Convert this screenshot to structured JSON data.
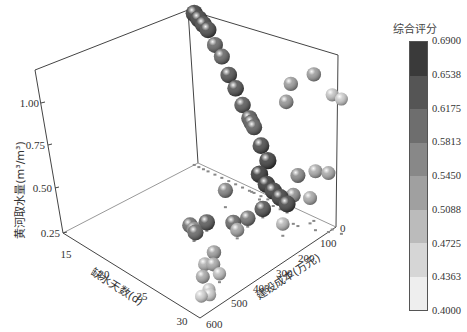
{
  "chart_data": {
    "type": "scatter",
    "dimensions": 3,
    "title": "",
    "xlabel": "缺水天数(d)",
    "ylabel": "建设成本(万元)",
    "zlabel": "黄河取水量(m³/m³)",
    "x_ticks": [
      "15",
      "20",
      "25",
      "30"
    ],
    "y_ticks": [
      "0",
      "100",
      "200",
      "300",
      "400",
      "500",
      "600"
    ],
    "z_ticks": [
      "0.25",
      "0.50",
      "0.75",
      "1.00"
    ],
    "xlim": [
      13,
      31
    ],
    "ylim": [
      0,
      600
    ],
    "zlim": [
      0.25,
      1.2
    ],
    "colorbar": {
      "title": "综合评分",
      "ticks": [
        "0.6900",
        "0.6538",
        "0.6175",
        "0.5813",
        "0.5450",
        "0.5088",
        "0.4725",
        "0.4363",
        "0.4000"
      ],
      "colors": [
        "#3a3a3a",
        "#555555",
        "#6e6e6e",
        "#888888",
        "#a0a0a0",
        "#bbbbbb",
        "#d6d6d6",
        "#eeeeee"
      ],
      "range": [
        0.4,
        0.69
      ]
    },
    "points": [
      {
        "x": 13.5,
        "y": 0,
        "z": 1.15,
        "score": 0.66
      },
      {
        "x": 13.5,
        "y": 20,
        "z": 1.13,
        "score": 0.66
      },
      {
        "x": 13.5,
        "y": 40,
        "z": 1.11,
        "score": 0.65
      },
      {
        "x": 13.5,
        "y": 60,
        "z": 1.09,
        "score": 0.64
      },
      {
        "x": 13.5,
        "y": 90,
        "z": 1.02,
        "score": 0.6
      },
      {
        "x": 13.5,
        "y": 120,
        "z": 0.97,
        "score": 0.6
      },
      {
        "x": 13.5,
        "y": 150,
        "z": 0.88,
        "score": 0.63
      },
      {
        "x": 13.5,
        "y": 180,
        "z": 0.82,
        "score": 0.63
      },
      {
        "x": 13.5,
        "y": 210,
        "z": 0.74,
        "score": 0.62
      },
      {
        "x": 13.5,
        "y": 240,
        "z": 0.68,
        "score": 0.62
      },
      {
        "x": 13.5,
        "y": 250,
        "z": 0.66,
        "score": 0.62
      },
      {
        "x": 13.5,
        "y": 260,
        "z": 0.64,
        "score": 0.61
      },
      {
        "x": 13.5,
        "y": 290,
        "z": 0.55,
        "score": 0.64
      },
      {
        "x": 13.5,
        "y": 320,
        "z": 0.48,
        "score": 0.66
      },
      {
        "x": 14.0,
        "y": 300,
        "z": 0.4,
        "score": 0.67
      },
      {
        "x": 14.0,
        "y": 330,
        "z": 0.36,
        "score": 0.67
      },
      {
        "x": 14.0,
        "y": 360,
        "z": 0.34,
        "score": 0.66
      },
      {
        "x": 14.0,
        "y": 390,
        "z": 0.32,
        "score": 0.66
      },
      {
        "x": 14.0,
        "y": 420,
        "z": 0.3,
        "score": 0.65
      },
      {
        "x": 16.0,
        "y": 380,
        "z": 0.3,
        "score": 0.63
      },
      {
        "x": 17.0,
        "y": 250,
        "z": 0.35,
        "score": 0.56
      },
      {
        "x": 13.5,
        "y": 400,
        "z": 0.88,
        "score": 0.53
      },
      {
        "x": 13.5,
        "y": 420,
        "z": 1.0,
        "score": 0.52
      },
      {
        "x": 13.5,
        "y": 520,
        "z": 1.12,
        "score": 0.52
      },
      {
        "x": 14.5,
        "y": 560,
        "z": 0.6,
        "score": 0.5
      },
      {
        "x": 14.0,
        "y": 520,
        "z": 0.4,
        "score": 0.5
      },
      {
        "x": 15.0,
        "y": 500,
        "z": 0.55,
        "score": 0.55
      },
      {
        "x": 15.0,
        "y": 480,
        "z": 0.42,
        "score": 0.54
      },
      {
        "x": 13.5,
        "y": 600,
        "z": 1.05,
        "score": 0.46
      },
      {
        "x": 13.5,
        "y": 640,
        "z": 1.05,
        "score": 0.45
      },
      {
        "x": 14.0,
        "y": 600,
        "z": 0.6,
        "score": 0.5
      },
      {
        "x": 17.0,
        "y": 500,
        "z": 0.32,
        "score": 0.48
      },
      {
        "x": 18.0,
        "y": 380,
        "z": 0.3,
        "score": 0.58
      },
      {
        "x": 19.0,
        "y": 350,
        "z": 0.28,
        "score": 0.6
      },
      {
        "x": 20.0,
        "y": 400,
        "z": 0.3,
        "score": 0.51
      },
      {
        "x": 21.0,
        "y": 300,
        "z": 0.3,
        "score": 0.62
      },
      {
        "x": 22.0,
        "y": 260,
        "z": 0.28,
        "score": 0.59
      },
      {
        "x": 22.5,
        "y": 300,
        "z": 0.28,
        "score": 0.6
      },
      {
        "x": 23.0,
        "y": 310,
        "z": 0.32,
        "score": 0.55
      },
      {
        "x": 24.0,
        "y": 430,
        "z": 0.3,
        "score": 0.52
      },
      {
        "x": 25.0,
        "y": 460,
        "z": 0.28,
        "score": 0.5
      },
      {
        "x": 25.5,
        "y": 440,
        "z": 0.28,
        "score": 0.49
      },
      {
        "x": 26.0,
        "y": 520,
        "z": 0.3,
        "score": 0.47
      },
      {
        "x": 27.0,
        "y": 480,
        "z": 0.28,
        "score": 0.5
      },
      {
        "x": 28.0,
        "y": 540,
        "z": 0.28,
        "score": 0.46
      },
      {
        "x": 28.5,
        "y": 560,
        "z": 0.28,
        "score": 0.45
      },
      {
        "x": 29.0,
        "y": 540,
        "z": 0.27,
        "score": 0.44
      }
    ],
    "grid": false,
    "legend_position": "right (colorbar)"
  }
}
